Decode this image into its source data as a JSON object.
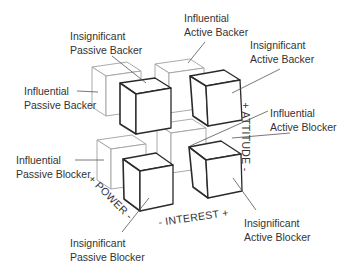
{
  "diagram": {
    "type": "stakeholder-cube",
    "colors": {
      "line": "#2a2a2a",
      "faint_line": "#aaaaaa",
      "text": "#333333",
      "background": "#ffffff"
    },
    "axes": {
      "attitude": "+ ATTITUDE -",
      "power": "+ POWER -",
      "interest": "- INTEREST +"
    },
    "labels": {
      "insig_passive_backer": {
        "line1": "Insignificant",
        "line2": "Passive Backer"
      },
      "infl_active_backer": {
        "line1": "Influential",
        "line2": "Active Backer"
      },
      "insig_active_backer": {
        "line1": "Insignificant",
        "line2": "Active Backer"
      },
      "infl_passive_backer": {
        "line1": "Influential",
        "line2": "Passive Backer"
      },
      "infl_active_blocker": {
        "line1": "Influential",
        "line2": "Active Blocker"
      },
      "infl_passive_blocker": {
        "line1": "Influential",
        "line2": "Passive Blocker"
      },
      "insig_active_blocker": {
        "line1": "Insignificant",
        "line2": "Active Blocker"
      },
      "insig_passive_blocker": {
        "line1": "Insignificant",
        "line2": "Passive Blocker"
      }
    }
  }
}
